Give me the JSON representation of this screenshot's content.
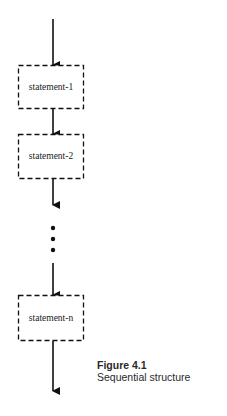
{
  "figure": {
    "title": "Sequential structure",
    "number": "Figure 4.1",
    "statements": [
      "statement-1",
      "statement-2",
      "statement-n"
    ],
    "ellipsis": "vertical-dots",
    "colors": {
      "stroke": "#111111",
      "background": "#ffffff"
    }
  }
}
